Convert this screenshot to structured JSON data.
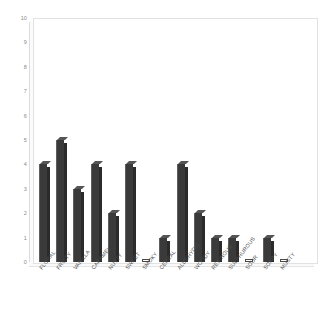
{
  "chart_data": {
    "type": "bar",
    "title": "",
    "xlabel": "",
    "ylabel": "",
    "ylim": [
      0,
      10
    ],
    "yticks": [
      10,
      9,
      8,
      7,
      6,
      5,
      4,
      3,
      2,
      1,
      0
    ],
    "grid": false,
    "legend": false,
    "categories": [
      "FLORAL",
      "FRUITY",
      "VANILLA",
      "CARAMEL",
      "NUTTY",
      "SWEET",
      "SMOKY",
      "CEREAL",
      "ALDEHYDIC",
      "WOODY",
      "RESINOUS",
      "SULPHUROUS",
      "SOUR",
      "SOAPY",
      "MUSTY"
    ],
    "values": [
      4,
      5,
      3,
      4,
      2,
      4,
      0,
      1,
      4,
      2,
      1,
      1,
      0,
      1,
      0
    ],
    "bar_color": "#3a3a3a",
    "plot_background": "#ffffff",
    "axis_color": "#e2e2e2",
    "tick_label_color": "#8a8a8a"
  }
}
